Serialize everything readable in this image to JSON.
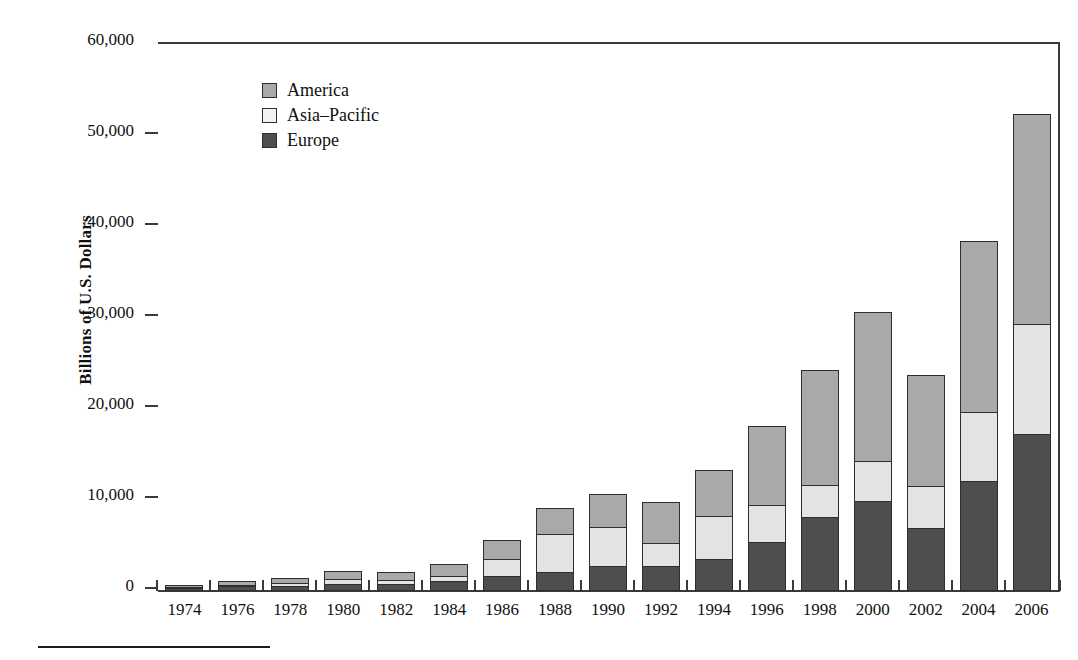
{
  "chart_data": {
    "type": "bar",
    "subtype": "stacked-vertical",
    "title": "",
    "xlabel": "",
    "ylabel": "Billions of U.S. Dollars",
    "ylim": [
      0,
      60000
    ],
    "ytick_values": [
      0,
      10000,
      20000,
      30000,
      40000,
      50000,
      60000
    ],
    "ytick_labels": [
      "0",
      "10,000",
      "20,000",
      "30,000",
      "40,000",
      "50,000",
      "60,000"
    ],
    "grid": false,
    "legend_position": "upper-left-inside",
    "categories": [
      "1974",
      "1976",
      "1978",
      "1980",
      "1982",
      "1984",
      "1986",
      "1988",
      "1990",
      "1992",
      "1994",
      "1996",
      "1998",
      "2000",
      "2002",
      "2004",
      "2006"
    ],
    "series": [
      {
        "name": "Europe",
        "color": "#4e4e4e",
        "values": [
          300,
          500,
          600,
          800,
          800,
          1100,
          1700,
          2100,
          2700,
          2800,
          3500,
          5400,
          8100,
          9900,
          6900,
          12100,
          17300
        ]
      },
      {
        "name": "Asia-Pacific",
        "color": "#e3e3e3",
        "values": [
          200,
          300,
          400,
          600,
          500,
          700,
          1900,
          4300,
          4500,
          2600,
          4900,
          4200,
          3700,
          4500,
          4700,
          7700,
          12100
        ]
      },
      {
        "name": "America",
        "color": "#a9a9a9",
        "values": [
          400,
          500,
          600,
          1000,
          1000,
          1400,
          2200,
          2900,
          3700,
          4600,
          5100,
          8800,
          12700,
          16500,
          12400,
          18900,
          23200
        ]
      }
    ],
    "totals": [
      900,
      1300,
      1600,
      2400,
      2300,
      3200,
      5800,
      9300,
      10900,
      10000,
      13500,
      18400,
      24500,
      30900,
      24000,
      38700,
      52600
    ]
  },
  "legend": {
    "items": [
      {
        "label": "America",
        "swatch": "america"
      },
      {
        "label": "Asia–Pacific",
        "swatch": "asia"
      },
      {
        "label": "Europe",
        "swatch": "europe"
      }
    ]
  },
  "colors": {
    "america": "#a9a9a9",
    "asia_pacific": "#e3e3e3",
    "europe": "#4e4e4e",
    "axis": "#3a3a3a",
    "text": "#111111",
    "background": "#ffffff"
  }
}
